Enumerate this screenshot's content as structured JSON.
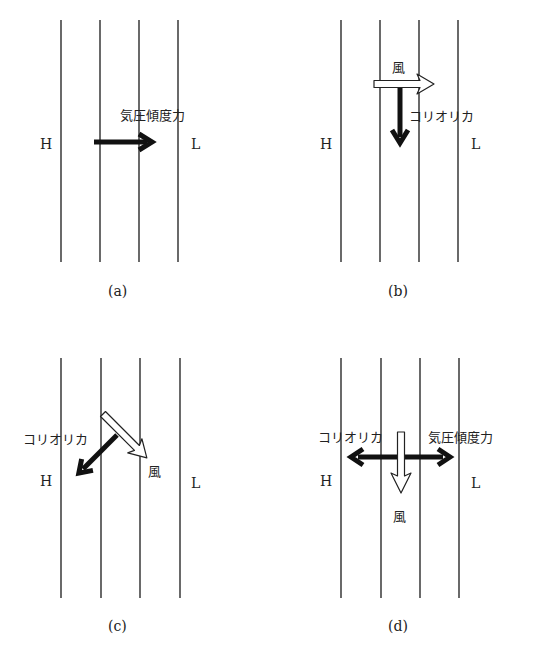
{
  "panels": [
    {
      "id": "a",
      "caption": "(a)",
      "high_label": "H",
      "low_label": "L",
      "forces": [
        {
          "name": "pressure-gradient-force",
          "label": "気圧傾度力",
          "style": "black",
          "direction": "right"
        }
      ]
    },
    {
      "id": "b",
      "caption": "(b)",
      "high_label": "H",
      "low_label": "L",
      "forces": [
        {
          "name": "wind",
          "label": "風",
          "style": "white",
          "direction": "right"
        },
        {
          "name": "coriolis-force",
          "label": "コリオリカ",
          "style": "black",
          "direction": "down"
        }
      ]
    },
    {
      "id": "c",
      "caption": "(c)",
      "high_label": "H",
      "low_label": "L",
      "forces": [
        {
          "name": "coriolis-force",
          "label": "コリオリカ",
          "style": "black",
          "direction": "down-left"
        },
        {
          "name": "wind",
          "label": "風",
          "style": "white",
          "direction": "down-right"
        }
      ]
    },
    {
      "id": "d",
      "caption": "(d)",
      "high_label": "H",
      "low_label": "L",
      "forces": [
        {
          "name": "coriolis-force",
          "label": "コリオリカ",
          "style": "black",
          "direction": "left"
        },
        {
          "name": "pressure-gradient-force",
          "label": "気圧傾度力",
          "style": "black",
          "direction": "right"
        },
        {
          "name": "wind",
          "label": "風",
          "style": "white",
          "direction": "down"
        }
      ]
    }
  ],
  "colors": {
    "line": "#1a1a1a",
    "black_arrow": "#111111",
    "white_arrow_fill": "#ffffff",
    "background": "#ffffff"
  }
}
